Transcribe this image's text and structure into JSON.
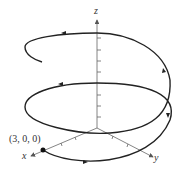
{
  "diagram": {
    "type": "3d-helix",
    "axes": {
      "x_label": "x",
      "y_label": "y",
      "z_label": "z"
    },
    "point_label": "(3, 0, 0)",
    "colors": {
      "curve": "#222222",
      "axes": "#555555"
    }
  }
}
